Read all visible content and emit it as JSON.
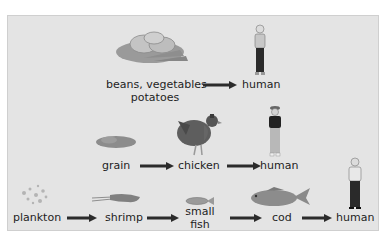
{
  "diagram": {
    "type": "food-chains",
    "chains": [
      {
        "id": "vegetarian",
        "nodes": [
          {
            "label": "beans, vegetables",
            "label2": "potatoes",
            "icon": "vegetables-icon"
          },
          {
            "label": "human",
            "icon": "woman-icon"
          }
        ]
      },
      {
        "id": "chicken",
        "nodes": [
          {
            "label": "grain",
            "icon": "grain-icon"
          },
          {
            "label": "chicken",
            "icon": "chicken-icon"
          },
          {
            "label": "human",
            "icon": "woman-icon"
          }
        ]
      },
      {
        "id": "ocean",
        "nodes": [
          {
            "label": "plankton",
            "icon": "plankton-icon"
          },
          {
            "label": "shrimp",
            "icon": "shrimp-icon"
          },
          {
            "label": "small",
            "label2": "fish",
            "icon": "small-fish-icon"
          },
          {
            "label": "cod",
            "icon": "cod-icon"
          },
          {
            "label": "human",
            "icon": "man-icon"
          }
        ]
      }
    ],
    "colors": {
      "panel_bg": "#e4e4e4",
      "arrow": "#2b2b2b",
      "text": "#1e1e1e"
    }
  }
}
